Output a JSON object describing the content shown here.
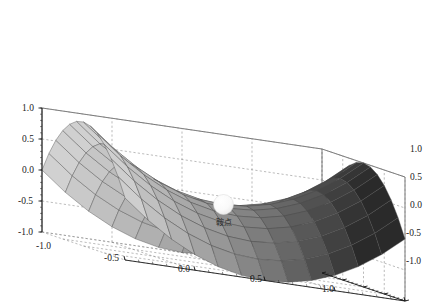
{
  "figure": {
    "type": "3d-surface-plot",
    "background_color": "#ffffff",
    "box_edge_color": "#555555",
    "grid_color": "#8d8d8d",
    "grid_style": "dashed",
    "axis_color": "#1a1a1a"
  },
  "chart_data": {
    "type": "surface",
    "title": "",
    "subtitle": "",
    "xlabel": "",
    "ylabel": "",
    "zlabel": "",
    "surface_function": "z = x^2 - y^2",
    "shape": "saddle (hyperbolic paraboloid)",
    "xlim": [
      -1.0,
      1.0
    ],
    "ylim": [
      -1.0,
      1.0
    ],
    "zlim": [
      -1.0,
      1.0
    ],
    "grid": true,
    "legend": "none",
    "mesh_steps": 12,
    "colormap": "grayscale",
    "surface_shading": {
      "light_color": "#e4e4e4",
      "mid_color": "#a8a8a8",
      "dark_color": "#2a2a2a",
      "wire_color": "#4a4a4a"
    },
    "x_ticks": [
      "-1.0",
      "-0.5",
      "0.0",
      "0.5",
      "1.0"
    ],
    "x_tick_values": [
      -1.0,
      -0.5,
      0.0,
      0.5,
      1.0
    ],
    "y_ticks": [
      "1.0",
      "0.5",
      "0.0",
      "-0.5",
      "-1.0"
    ],
    "y_tick_values": [
      1.0,
      0.5,
      0.0,
      -0.5,
      -1.0
    ],
    "z_ticks": [
      "1.0",
      "0.5",
      "0.0",
      "-0.5",
      "-1.0"
    ],
    "z_tick_values": [
      1.0,
      0.5,
      0.0,
      -0.5,
      -1.0
    ],
    "annotations": [
      {
        "name": "saddle-point",
        "label": "鞍点",
        "x": 0.0,
        "y": 0.0,
        "z": 0.0,
        "marker": "sphere",
        "marker_color": "#fbfbfb",
        "marker_radius_px": 10
      }
    ],
    "view": {
      "elevation_deg": 28,
      "azimuth_deg": -48
    }
  },
  "axes": {
    "z_axis": {
      "name": "z-axis",
      "ticks": [
        {
          "label": "1.0",
          "x": 22,
          "y": 111
        },
        {
          "label": "0.5",
          "x": 22,
          "y": 142
        },
        {
          "label": "0.0",
          "x": 22,
          "y": 173
        },
        {
          "label": "-0.5",
          "x": 18,
          "y": 204
        },
        {
          "label": "-1.0",
          "x": 18,
          "y": 235
        }
      ]
    },
    "x_axis": {
      "name": "x-axis",
      "ticks": [
        {
          "label": "-1.0",
          "x": 36,
          "y": 249
        },
        {
          "label": "-0.5",
          "x": 104,
          "y": 261
        },
        {
          "label": "0.0",
          "x": 178,
          "y": 272
        },
        {
          "label": "0.5",
          "x": 250,
          "y": 282
        },
        {
          "label": "1.0",
          "x": 322,
          "y": 292
        }
      ]
    },
    "y_axis": {
      "name": "y-axis",
      "ticks": [
        {
          "label": "1.0",
          "x": 410,
          "y": 152
        },
        {
          "label": "0.5",
          "x": 410,
          "y": 180
        },
        {
          "label": "0.0",
          "x": 410,
          "y": 208
        },
        {
          "label": "-0.5",
          "x": 406,
          "y": 236
        },
        {
          "label": "-1.0",
          "x": 406,
          "y": 264
        }
      ]
    }
  }
}
